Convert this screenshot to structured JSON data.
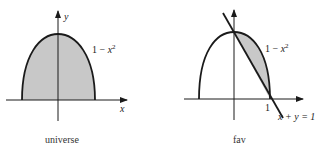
{
  "diagrams": [
    {
      "caption": "universe",
      "axis_x_label": "x",
      "axis_y_label": "y",
      "curve_label_prefix": "1 − ",
      "curve_label_var": "x",
      "curve_label_exp": "2",
      "shaded_region": "area under 1 − x² above x-axis",
      "fill_color": "#c8c8c8"
    },
    {
      "caption": "fav",
      "curve_label_prefix": "1 − ",
      "curve_label_var": "x",
      "curve_label_exp": "2",
      "tick_label": "1",
      "line_label": "x + y = 1",
      "shaded_region": "between 1 − x² and line x + y = 1 for 0 ≤ x ≤ 1",
      "fill_color": "#c8c8c8"
    }
  ],
  "colors": {
    "stroke": "#1a1a1a",
    "fill": "#c8c8c8"
  }
}
